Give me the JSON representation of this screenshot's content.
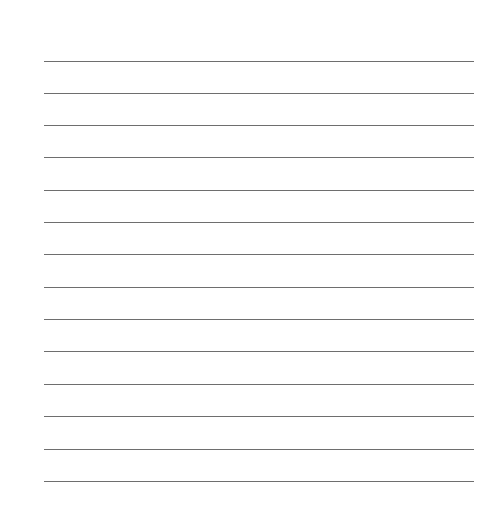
{
  "page": {
    "type": "lined-paper",
    "line_count": 14,
    "line_color": "#6e6e6e",
    "background": "#ffffff",
    "lines": [
      {
        "top": 61
      },
      {
        "top": 93
      },
      {
        "top": 125
      },
      {
        "top": 157
      },
      {
        "top": 190
      },
      {
        "top": 222
      },
      {
        "top": 254
      },
      {
        "top": 287
      },
      {
        "top": 319
      },
      {
        "top": 351
      },
      {
        "top": 384
      },
      {
        "top": 416
      },
      {
        "top": 449
      },
      {
        "top": 481
      }
    ]
  }
}
